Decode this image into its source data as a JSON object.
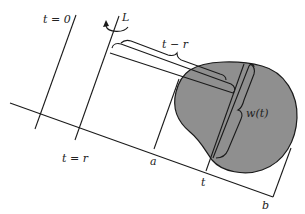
{
  "diagram": {
    "labels": {
      "t_zero": "t = 0",
      "rotation_axis": "L",
      "t_minus_r": "t − r",
      "width": "w(t)",
      "t_equals_r": "t = r",
      "point_a": "a",
      "point_t": "t",
      "point_b": "b"
    },
    "colors": {
      "region_fill": "#8f8f8f",
      "line": "#1a1a1a",
      "background": "#ffffff"
    }
  }
}
